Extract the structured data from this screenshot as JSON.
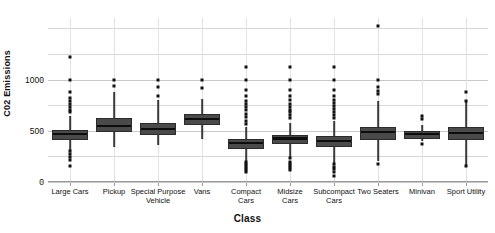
{
  "chart_data": {
    "type": "box",
    "title": "",
    "xlabel": "Class",
    "ylabel": "C02 Emissions",
    "ylim": [
      0,
      1600
    ],
    "yticks": [
      0,
      500,
      1000
    ],
    "ytick_labels": [
      "0",
      "500",
      "1000"
    ],
    "minor_gridlines": [
      250,
      750,
      1250,
      1500
    ],
    "grid": true,
    "legend": "none",
    "categories": [
      "Large Cars",
      "Pickup",
      "Special Purpose\nVehicle",
      "Vans",
      "Compact\nCars",
      "Midsize\nCars",
      "Subcompact\nCars",
      "Two Seaters",
      "Minivan",
      "Sport Utility"
    ],
    "boxes": [
      {
        "category": "Large Cars",
        "whisker_low": 300,
        "q1": 430,
        "median": 470,
        "q3": 505,
        "whisker_high": 640,
        "outliers": [
          1220,
          1000,
          880,
          820,
          790,
          760,
          730,
          700,
          680,
          300,
          270,
          240,
          210,
          160
        ]
      },
      {
        "category": "Pickup",
        "whisker_low": 340,
        "q1": 510,
        "median": 545,
        "q3": 620,
        "whisker_high": 880,
        "outliers": [
          1000,
          940
        ]
      },
      {
        "category": "Special Purpose Vehicle",
        "whisker_low": 360,
        "q1": 480,
        "median": 515,
        "q3": 580,
        "whisker_high": 800,
        "outliers": [
          1000,
          930,
          840
        ]
      },
      {
        "category": "Vans",
        "whisker_low": 420,
        "q1": 580,
        "median": 615,
        "q3": 665,
        "whisker_high": 810,
        "outliers": [
          1000,
          920
        ]
      },
      {
        "category": "Compact Cars",
        "whisker_low": 200,
        "q1": 345,
        "median": 380,
        "q3": 420,
        "whisker_high": 540,
        "outliers": [
          1120,
          1000,
          900,
          840,
          790,
          760,
          730,
          700,
          660,
          630,
          600,
          570,
          200,
          180,
          160,
          140,
          120,
          100
        ]
      },
      {
        "category": "Midsize Cars",
        "whisker_low": 230,
        "q1": 390,
        "median": 425,
        "q3": 460,
        "whisker_high": 580,
        "outliers": [
          1120,
          1000,
          900,
          840,
          800,
          760,
          730,
          700,
          680,
          650,
          620,
          230,
          200,
          180,
          160,
          140,
          120
        ]
      },
      {
        "category": "Subcompact Cars",
        "whisker_low": 180,
        "q1": 360,
        "median": 400,
        "q3": 450,
        "whisker_high": 600,
        "outliers": [
          1120,
          1000,
          900,
          840,
          800,
          770,
          740,
          710,
          680,
          650,
          620,
          180,
          150,
          130,
          100,
          60
        ]
      },
      {
        "category": "Two Seaters",
        "whisker_low": 200,
        "q1": 430,
        "median": 490,
        "q3": 540,
        "whisker_high": 790,
        "outliers": [
          1520,
          1000,
          930,
          890,
          860,
          180
        ]
      },
      {
        "category": "Minivan",
        "whisker_low": 400,
        "q1": 440,
        "median": 470,
        "q3": 500,
        "whisker_high": 560,
        "outliers": [
          640,
          610,
          370
        ]
      },
      {
        "category": "Sport Utility",
        "whisker_low": 160,
        "q1": 430,
        "median": 480,
        "q3": 540,
        "whisker_high": 790,
        "outliers": [
          880,
          790,
          160
        ]
      }
    ]
  }
}
